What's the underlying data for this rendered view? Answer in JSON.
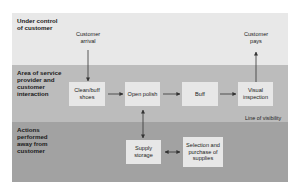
{
  "diagram": {
    "bands": [
      {
        "label": "Under control of customer",
        "color": "#e8e8e8"
      },
      {
        "label": "Area of service provider and customer interaction",
        "color": "#bcbcbc"
      },
      {
        "label": "Actions performed away from customer",
        "color": "#a2a2a2"
      }
    ],
    "nodes": {
      "customer_arrival": "Customer arrival",
      "customer_pays": "Customer pays",
      "clean_buff": "Clean/buff shoes",
      "open_polish": "Open polish",
      "buff": "Buff",
      "visual_inspection": "Visual inspection",
      "supply_storage": "Supply storage",
      "selection_purchase": "Selection and purchase of supplies"
    },
    "line_of_visibility": "Line of visibility",
    "edges": [
      {
        "from": "Customer arrival",
        "to": "Clean/buff shoes"
      },
      {
        "from": "Clean/buff shoes",
        "to": "Open polish"
      },
      {
        "from": "Open polish",
        "to": "Buff"
      },
      {
        "from": "Buff",
        "to": "Visual inspection"
      },
      {
        "from": "Visual inspection",
        "to": "Customer pays"
      },
      {
        "from": "Supply storage",
        "to": "Open polish",
        "bidirectional": true
      },
      {
        "from": "Supply storage",
        "to": "Selection and purchase of supplies",
        "bidirectional": true
      }
    ],
    "colors": {
      "box": "#e7e7e7",
      "arrow": "#333333"
    }
  }
}
